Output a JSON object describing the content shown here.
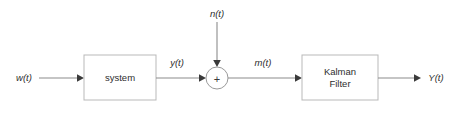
{
  "diagram": {
    "type": "block-diagram",
    "background_color": "#ffffff",
    "line_color": "#8c8c8c",
    "box_border_color": "#b9b9b9",
    "text_color": "#2e2e2e",
    "width": 462,
    "height": 113,
    "blocks": [
      {
        "id": "system",
        "label": "system",
        "x": 84,
        "y": 55,
        "w": 72,
        "h": 45
      },
      {
        "id": "kalman",
        "label_line1": "Kalman",
        "label_line2": "Filter",
        "x": 302,
        "y": 55,
        "w": 76,
        "h": 45
      }
    ],
    "summing_junction": {
      "id": "sum",
      "symbol": "+",
      "cx": 217,
      "cy": 78,
      "r": 11
    },
    "signals": [
      {
        "id": "w",
        "label": "w(t)",
        "x": 24,
        "y": 81,
        "role": "input"
      },
      {
        "id": "y",
        "label": "y(t)",
        "x": 177,
        "y": 66,
        "role": "intermediate"
      },
      {
        "id": "n",
        "label": "n(t)",
        "x": 217,
        "y": 17,
        "role": "noise-input"
      },
      {
        "id": "m",
        "label": "m(t)",
        "x": 263,
        "y": 66,
        "role": "intermediate"
      },
      {
        "id": "Y",
        "label": "Y(t)",
        "x": 436,
        "y": 81,
        "role": "output"
      }
    ],
    "connections": [
      {
        "from": "w",
        "to": "system",
        "orientation": "horizontal"
      },
      {
        "from": "system",
        "to": "sum",
        "orientation": "horizontal",
        "label": "y(t)"
      },
      {
        "from": "n",
        "to": "sum",
        "orientation": "vertical",
        "label": "n(t)"
      },
      {
        "from": "sum",
        "to": "kalman",
        "orientation": "horizontal",
        "label": "m(t)"
      },
      {
        "from": "kalman",
        "to": "Y",
        "orientation": "horizontal",
        "label": "Y(t)"
      }
    ]
  }
}
